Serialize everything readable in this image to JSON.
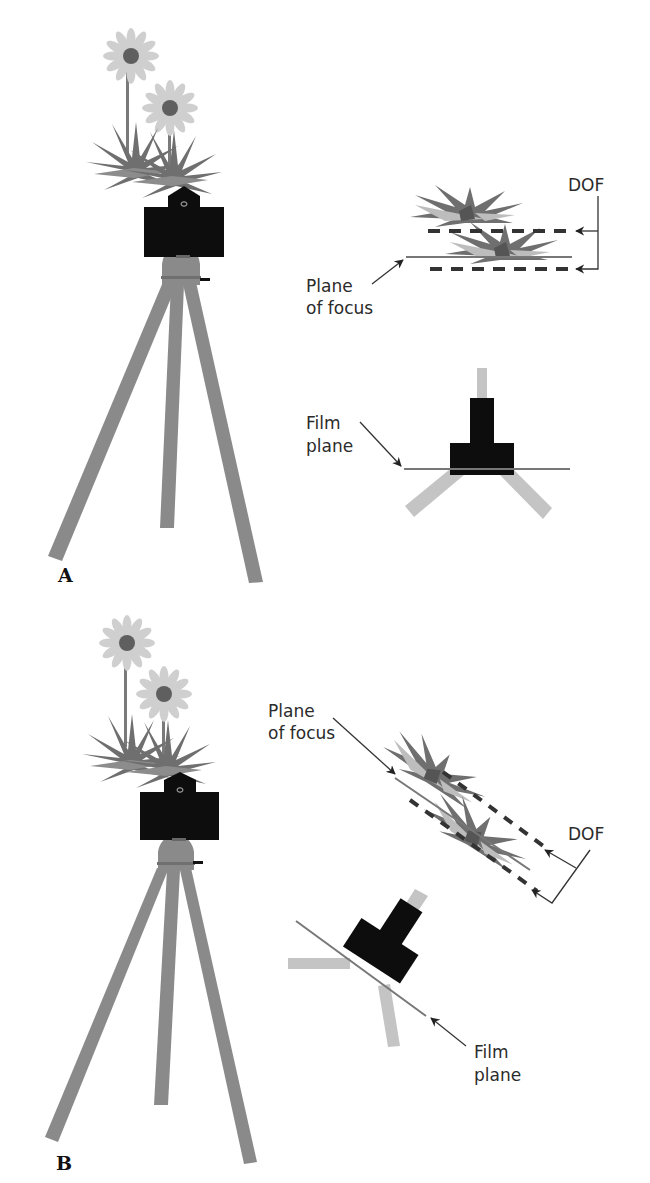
{
  "figure": {
    "type": "illustration",
    "colors": {
      "tripod": "#8a8a8a",
      "camera": "#0d0d0d",
      "petal": "#cfcfcf",
      "flower_center": "#5f5f5f",
      "foliage_dark": "#6f6f6f",
      "foliage_light": "#bdbdbd",
      "line": "#555555",
      "dash": "#333333",
      "text": "#2b2b2b"
    }
  },
  "panels": [
    {
      "id": "A",
      "label": "A",
      "description": "Camera level; film plane parallel to plane of focus; DOF spans front of plants",
      "annotations": {
        "dof": "DOF",
        "plane_of_focus_line1": "Plane",
        "plane_of_focus_line2": "of focus",
        "film_plane_line1": "Film",
        "film_plane_line2": "plane"
      }
    },
    {
      "id": "B",
      "label": "B",
      "description": "Camera tilted; film plane tilted so plane of focus runs through both plants",
      "annotations": {
        "dof": "DOF",
        "plane_of_focus_line1": "Plane",
        "plane_of_focus_line2": "of focus",
        "film_plane_line1": "Film",
        "film_plane_line2": "plane"
      }
    }
  ]
}
